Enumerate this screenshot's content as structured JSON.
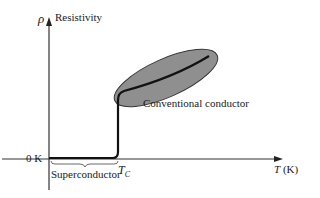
{
  "figure": {
    "y_axis": {
      "symbol": "ρ",
      "label": "Resistivity"
    },
    "x_axis": {
      "symbol": "T",
      "unit": "(K)",
      "origin_label": "0 K"
    },
    "critical_temp": {
      "symbol": "T",
      "subscript": "C"
    },
    "regions": {
      "superconductor": "Superconductor",
      "conventional": "Conventional conductor"
    },
    "colors": {
      "ellipse_fill": "#8f8f8f",
      "curve": "#111111",
      "axis": "#333333"
    }
  }
}
